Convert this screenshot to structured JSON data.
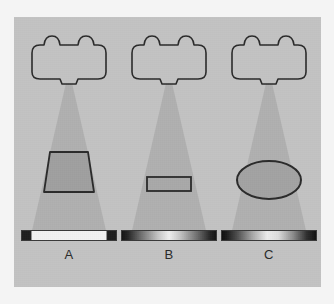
{
  "figure": {
    "background_color": "#f4f4f4",
    "panel_color": "#c3c3c3",
    "beam_color": "#b0b0b0",
    "outline_color": "#2b2b2b",
    "object_fill_color": "#a8a8a8",
    "panel": {
      "x": 14,
      "y": 17,
      "width": 307,
      "height": 270
    }
  },
  "columns": [
    {
      "id": "A",
      "label": "A",
      "left": 18,
      "source": {
        "name": "x-ray-tube-housing",
        "width": 86,
        "height": 43,
        "top": 22,
        "bump_count": 2,
        "has_bottom_port": true
      },
      "beam": {
        "name": "cone-beam",
        "apex_y": 66,
        "apex_half_width": 3,
        "base_y": 218,
        "base_half_width": 38
      },
      "object": {
        "name": "trapezoid-object",
        "shape": "trapezoid",
        "top_width": 38,
        "bottom_width": 50,
        "height": 40,
        "center_y": 155,
        "fill": "#a0a0a0"
      },
      "detector": {
        "name": "detector-bar",
        "width": 96,
        "profile": "uniform-bright-center-dark-ends",
        "stops": [
          {
            "pos": 0,
            "color": "#1e1e1e"
          },
          {
            "pos": 9,
            "color": "#1e1e1e"
          },
          {
            "pos": 11,
            "color": "#f2f2f2"
          },
          {
            "pos": 89,
            "color": "#f2f2f2"
          },
          {
            "pos": 91,
            "color": "#1e1e1e"
          },
          {
            "pos": 100,
            "color": "#1e1e1e"
          }
        ]
      }
    },
    {
      "id": "B",
      "label": "B",
      "left": 118,
      "source": {
        "name": "x-ray-tube-housing",
        "width": 86,
        "height": 43,
        "top": 22,
        "bump_count": 2,
        "has_bottom_port": true
      },
      "beam": {
        "name": "cone-beam",
        "apex_y": 66,
        "apex_half_width": 3,
        "base_y": 218,
        "base_half_width": 38
      },
      "object": {
        "name": "thin-slab-object",
        "shape": "rectangle",
        "top_width": 44,
        "bottom_width": 44,
        "height": 14,
        "center_y": 167,
        "fill": "#a9a9a9"
      },
      "detector": {
        "name": "detector-bar",
        "width": 96,
        "profile": "smooth-gradient-dark-edges-light-center",
        "stops": [
          {
            "pos": 0,
            "color": "#141414"
          },
          {
            "pos": 6,
            "color": "#242424"
          },
          {
            "pos": 20,
            "color": "#6e6e6e"
          },
          {
            "pos": 38,
            "color": "#c4c4c4"
          },
          {
            "pos": 50,
            "color": "#efefef"
          },
          {
            "pos": 62,
            "color": "#c4c4c4"
          },
          {
            "pos": 80,
            "color": "#6e6e6e"
          },
          {
            "pos": 94,
            "color": "#242424"
          },
          {
            "pos": 100,
            "color": "#141414"
          }
        ]
      }
    },
    {
      "id": "C",
      "label": "C",
      "left": 218,
      "source": {
        "name": "x-ray-tube-housing",
        "width": 86,
        "height": 43,
        "top": 22,
        "bump_count": 2,
        "has_bottom_port": true
      },
      "beam": {
        "name": "cone-beam",
        "apex_y": 66,
        "apex_half_width": 3,
        "base_y": 218,
        "base_half_width": 38
      },
      "object": {
        "name": "ellipse-object",
        "shape": "ellipse",
        "top_width": 64,
        "bottom_width": 64,
        "height": 38,
        "center_y": 163,
        "fill": "#a3a3a3"
      },
      "detector": {
        "name": "detector-bar",
        "width": 96,
        "profile": "broad-soft-gradient-dark-edges-light-center",
        "stops": [
          {
            "pos": 0,
            "color": "#101010"
          },
          {
            "pos": 5,
            "color": "#1c1c1c"
          },
          {
            "pos": 16,
            "color": "#4e4e4e"
          },
          {
            "pos": 32,
            "color": "#a6a6a6"
          },
          {
            "pos": 48,
            "color": "#ececec"
          },
          {
            "pos": 60,
            "color": "#dcdcdc"
          },
          {
            "pos": 76,
            "color": "#8a8a8a"
          },
          {
            "pos": 90,
            "color": "#303030"
          },
          {
            "pos": 100,
            "color": "#101010"
          }
        ]
      }
    }
  ]
}
